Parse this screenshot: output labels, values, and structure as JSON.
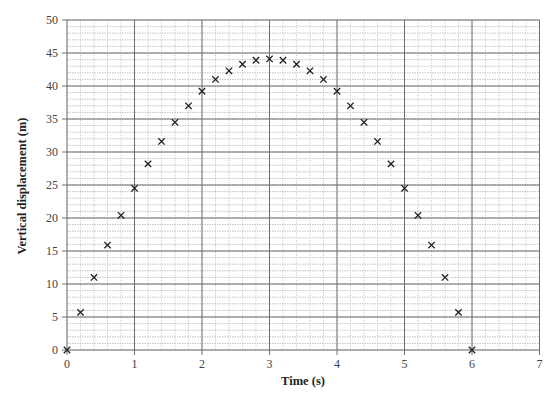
{
  "chart_data": {
    "type": "scatter",
    "title": "",
    "xlabel": "Time (s)",
    "ylabel": "Vertical displacement (m)",
    "xlim": [
      0,
      7
    ],
    "ylim": [
      0,
      50
    ],
    "x_ticks": [
      0,
      1,
      2,
      3,
      4,
      5,
      6,
      7
    ],
    "y_ticks": [
      0,
      5,
      10,
      15,
      20,
      25,
      30,
      35,
      40,
      45,
      50
    ],
    "grid": {
      "major": true,
      "minor": true,
      "major_x_step": 1,
      "major_y_step": 5,
      "minor_x_step": 0.2,
      "minor_y_step": 1
    },
    "legend": null,
    "marker": "x",
    "series": [
      {
        "name": "Vertical displacement",
        "x": [
          0,
          0.2,
          0.4,
          0.6,
          0.8,
          1.0,
          1.2,
          1.4,
          1.6,
          1.8,
          2.0,
          2.2,
          2.4,
          2.6,
          2.8,
          3.0,
          3.2,
          3.4,
          3.6,
          3.8,
          4.0,
          4.2,
          4.4,
          4.6,
          4.8,
          5.0,
          5.2,
          5.4,
          5.6,
          5.8,
          6.0
        ],
        "y": [
          0,
          5.7,
          11.0,
          15.9,
          20.4,
          24.5,
          28.2,
          31.6,
          34.5,
          37.0,
          39.2,
          41.0,
          42.3,
          43.3,
          43.9,
          44.1,
          43.9,
          43.3,
          42.3,
          41.0,
          39.2,
          37.0,
          34.5,
          31.6,
          28.2,
          24.5,
          20.4,
          15.9,
          11.0,
          5.7,
          0
        ]
      }
    ]
  },
  "colors": {
    "major_grid": "#6e6e6e",
    "minor_grid": "#b5b5b5",
    "marker": "#222222",
    "tick_text": "#444444"
  }
}
